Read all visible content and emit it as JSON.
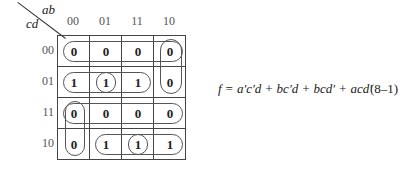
{
  "kmap": {
    "row_var": "cd",
    "col_var": "ab",
    "columns": [
      "00",
      "01",
      "11",
      "10"
    ],
    "rows": [
      "00",
      "01",
      "11",
      "10"
    ],
    "cells": [
      [
        "0",
        "0",
        "0",
        "0"
      ],
      [
        "1",
        "1",
        "1",
        "0"
      ],
      [
        "0",
        "0",
        "0",
        "0"
      ],
      [
        "0",
        "1",
        "1",
        "1"
      ]
    ]
  },
  "equation": {
    "text": "f = a′c′d + bc′d + bcd′ + acd′",
    "number": "(8–1)"
  }
}
